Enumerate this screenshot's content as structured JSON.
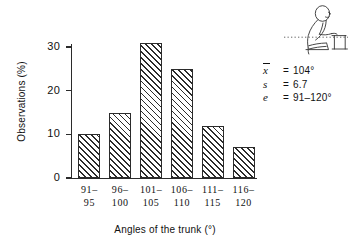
{
  "chart_data": {
    "type": "bar",
    "title": "",
    "xlabel": "Angles of the trunk (°)",
    "ylabel": "Observations (%)",
    "categories": [
      "91–\n95",
      "96–\n100",
      "101–\n105",
      "106–\n110",
      "111–\n115",
      "116–\n120"
    ],
    "category_lines": [
      [
        "91–",
        "95"
      ],
      [
        "96–",
        "100"
      ],
      [
        "101–",
        "105"
      ],
      [
        "106–",
        "110"
      ],
      [
        "111–",
        "115"
      ],
      [
        "116–",
        "120"
      ]
    ],
    "values": [
      10,
      15,
      31,
      25,
      12,
      7
    ],
    "ylim": [
      0,
      32
    ],
    "yticks": [
      0,
      10,
      20,
      30
    ],
    "ytick_labels": [
      "0",
      "10",
      "20",
      "30"
    ],
    "grid": false,
    "legend": "none",
    "bar_fill": "diagonal-hatch",
    "bar_color": "#2b2b2b"
  },
  "axes": {
    "y_title": "Observations (%)",
    "x_title": "Angles of the trunk (°)"
  },
  "stats": {
    "rows": [
      {
        "symbol": "x",
        "overbar": true,
        "equals": "=",
        "value": "104°"
      },
      {
        "symbol": "s",
        "overbar": false,
        "equals": "=",
        "value": "6.7"
      },
      {
        "symbol": "e",
        "overbar": false,
        "equals": "=",
        "value": "91–120°"
      }
    ]
  },
  "pictogram": {
    "name": "seated-person-leaning-forward",
    "description": "seated person leaning forward at a desk with dotted horizontal reference line"
  }
}
